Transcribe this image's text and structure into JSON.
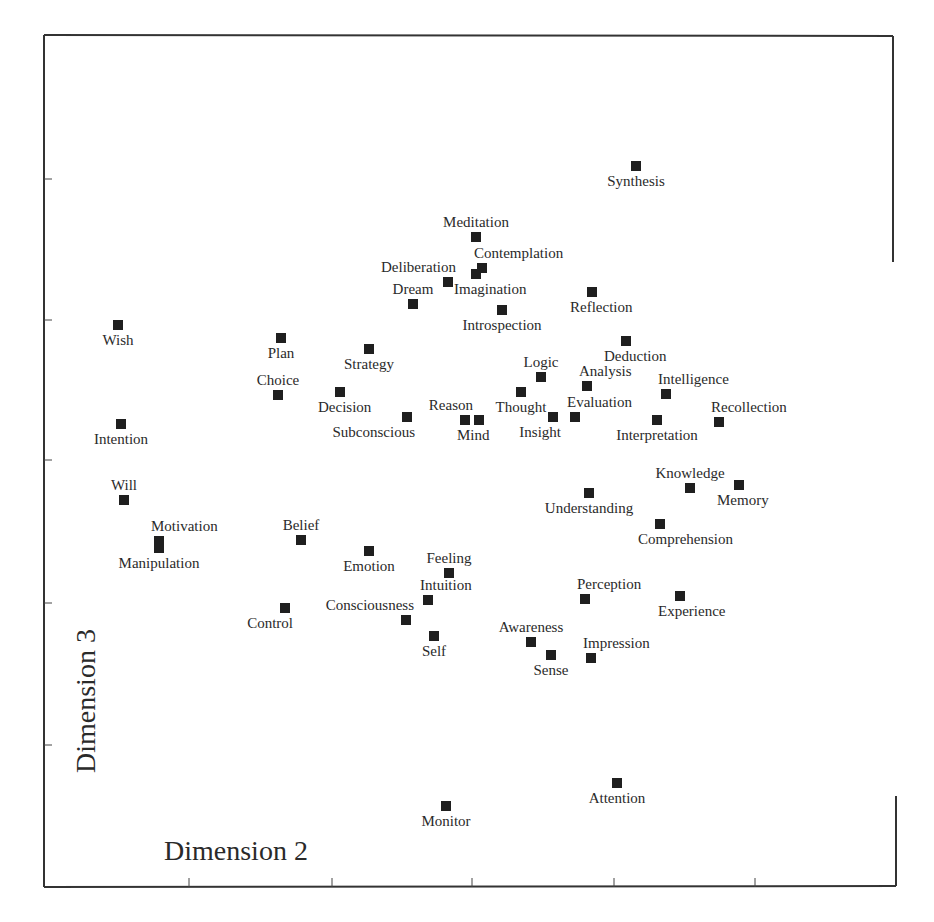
{
  "chart_data": {
    "type": "scatter",
    "title": "",
    "xlabel": "Dimension 2",
    "ylabel": "Dimension 3",
    "grid": false,
    "legend": null,
    "marker": "filled-square",
    "x_ticks_px": [
      189,
      332,
      472,
      614,
      755
    ],
    "y_ticks_px": [
      179,
      320,
      460,
      603,
      745
    ],
    "note": "Coordinates are in pixel space of the original plot (no numeric tick labels shown); y increases downward.",
    "frame": {
      "left": 44,
      "top": 35,
      "right": 893,
      "bottom": 887
    },
    "points": [
      {
        "label": "Synthesis",
        "x": 636,
        "y": 166,
        "pos": "below"
      },
      {
        "label": "Meditation",
        "x": 476,
        "y": 237,
        "pos": "above"
      },
      {
        "label": "Contemplation",
        "x": 482,
        "y": 268,
        "pos": "above-right"
      },
      {
        "label": "Imagination",
        "x": 476,
        "y": 274,
        "pos": "below-right"
      },
      {
        "label": "Deliberation",
        "x": 448,
        "y": 282,
        "pos": "above-left"
      },
      {
        "label": "Dream",
        "x": 413,
        "y": 304,
        "pos": "above"
      },
      {
        "label": "Introspection",
        "x": 502,
        "y": 310,
        "pos": "below"
      },
      {
        "label": "Reflection",
        "x": 592,
        "y": 292,
        "pos": "below-right"
      },
      {
        "label": "Wish",
        "x": 118,
        "y": 325,
        "pos": "below"
      },
      {
        "label": "Plan",
        "x": 281,
        "y": 338,
        "pos": "below"
      },
      {
        "label": "Strategy",
        "x": 369,
        "y": 349,
        "pos": "below"
      },
      {
        "label": "Deduction",
        "x": 626,
        "y": 341,
        "pos": "below-right"
      },
      {
        "label": "Logic",
        "x": 541,
        "y": 377,
        "pos": "above"
      },
      {
        "label": "Analysis",
        "x": 587,
        "y": 386,
        "pos": "above-right"
      },
      {
        "label": "Choice",
        "x": 278,
        "y": 395,
        "pos": "above"
      },
      {
        "label": "Decision",
        "x": 340,
        "y": 392,
        "pos": "below-right"
      },
      {
        "label": "Thought",
        "x": 521,
        "y": 392,
        "pos": "below"
      },
      {
        "label": "Intelligence",
        "x": 666,
        "y": 394,
        "pos": "above-right"
      },
      {
        "label": "Intention",
        "x": 121,
        "y": 424,
        "pos": "below"
      },
      {
        "label": "Subconscious",
        "x": 407,
        "y": 417,
        "pos": "below-left"
      },
      {
        "label": "Reason",
        "x": 465,
        "y": 420,
        "pos": "above-left"
      },
      {
        "label": "Mind",
        "x": 479,
        "y": 420,
        "pos": "below-right"
      },
      {
        "label": "Insight",
        "x": 553,
        "y": 417,
        "pos": "below-left"
      },
      {
        "label": "Evaluation",
        "x": 575,
        "y": 417,
        "pos": "above-right"
      },
      {
        "label": "Interpretation",
        "x": 657,
        "y": 420,
        "pos": "below"
      },
      {
        "label": "Recollection",
        "x": 719,
        "y": 422,
        "pos": "above-right"
      },
      {
        "label": "Will",
        "x": 124,
        "y": 500,
        "pos": "above"
      },
      {
        "label": "Knowledge",
        "x": 690,
        "y": 488,
        "pos": "above"
      },
      {
        "label": "Memory",
        "x": 739,
        "y": 485,
        "pos": "below-right"
      },
      {
        "label": "Understanding",
        "x": 589,
        "y": 493,
        "pos": "below"
      },
      {
        "label": "Motivation",
        "x": 159,
        "y": 541,
        "pos": "above-right"
      },
      {
        "label": "Manipulation",
        "x": 159,
        "y": 548,
        "pos": "below"
      },
      {
        "label": "Belief",
        "x": 301,
        "y": 540,
        "pos": "above"
      },
      {
        "label": "Comprehension",
        "x": 660,
        "y": 524,
        "pos": "below-right"
      },
      {
        "label": "Emotion",
        "x": 369,
        "y": 551,
        "pos": "below"
      },
      {
        "label": "Feeling",
        "x": 449,
        "y": 573,
        "pos": "above"
      },
      {
        "label": "Intuition",
        "x": 428,
        "y": 600,
        "pos": "above-right"
      },
      {
        "label": "Control",
        "x": 285,
        "y": 608,
        "pos": "below-left"
      },
      {
        "label": "Consciousness",
        "x": 406,
        "y": 620,
        "pos": "above-left"
      },
      {
        "label": "Perception",
        "x": 585,
        "y": 599,
        "pos": "above-right"
      },
      {
        "label": "Experience",
        "x": 680,
        "y": 596,
        "pos": "below-right"
      },
      {
        "label": "Self",
        "x": 434,
        "y": 636,
        "pos": "below"
      },
      {
        "label": "Awareness",
        "x": 531,
        "y": 642,
        "pos": "above"
      },
      {
        "label": "Impression",
        "x": 591,
        "y": 658,
        "pos": "above-right"
      },
      {
        "label": "Sense",
        "x": 551,
        "y": 655,
        "pos": "below"
      },
      {
        "label": "Attention",
        "x": 617,
        "y": 783,
        "pos": "below"
      },
      {
        "label": "Monitor",
        "x": 446,
        "y": 806,
        "pos": "below"
      }
    ]
  },
  "axes": {
    "x_title": "Dimension 2",
    "y_title": "Dimension 3"
  },
  "colors": {
    "marker": "#1f1f1f",
    "frame": "#333333",
    "text": "#2a2a2a",
    "background": "#ffffff"
  }
}
